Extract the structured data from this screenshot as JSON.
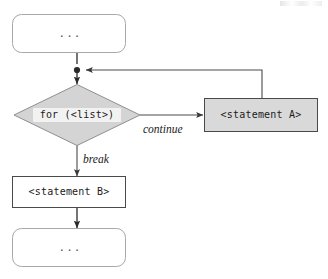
{
  "diagram": {
    "type": "flowchart",
    "colors": {
      "background": "#ffffff",
      "diamond_fill": "#d4d4d4",
      "diamond_stroke": "#8f8f8f",
      "filled_box_fill": "#d9d9d9",
      "box_stroke": "#4a4a4a",
      "rounded_stroke": "#a8a8a8",
      "edge_stroke": "#3a3a3a",
      "label_plate": "#f2f2f2",
      "text": "#1a1a1a",
      "ellipsis_text": "#5a5a5a"
    },
    "nodes": {
      "top_context": {
        "id": "top-context",
        "shape": "rounded-rect",
        "label": "...",
        "fill": "white"
      },
      "condition": {
        "id": "for-condition",
        "shape": "diamond",
        "label": "for (<list>)",
        "fill": "gray"
      },
      "statement_a": {
        "id": "statement-a",
        "shape": "rect",
        "label": "<statement A>",
        "fill": "gray"
      },
      "statement_b": {
        "id": "statement-b",
        "shape": "rect",
        "label": "<statement B>",
        "fill": "white"
      },
      "bottom_context": {
        "id": "bottom-context",
        "shape": "rounded-rect",
        "label": "...",
        "fill": "white"
      }
    },
    "edges": [
      {
        "id": "edge-top-to-condition",
        "from": "top-context",
        "to": "for-condition",
        "label": "",
        "style": "solid-arrow"
      },
      {
        "id": "edge-condition-to-statement-a",
        "from": "for-condition",
        "to": "statement-a",
        "label": "continue",
        "style": "solid-arrow"
      },
      {
        "id": "edge-statement-a-loopback",
        "from": "statement-a",
        "to": "for-condition",
        "label": "",
        "style": "solid-arrow-orthogonal"
      },
      {
        "id": "edge-condition-to-statement-b",
        "from": "for-condition",
        "to": "statement-b",
        "label": "break",
        "style": "solid-arrow"
      },
      {
        "id": "edge-statement-b-to-bottom",
        "from": "statement-b",
        "to": "bottom-context",
        "label": "",
        "style": "solid-arrow"
      }
    ],
    "edge_labels": {
      "continue": "continue",
      "break": "break"
    },
    "junction": {
      "id": "loop-junction",
      "description": "merge point where loop-back rejoins main flow"
    }
  }
}
